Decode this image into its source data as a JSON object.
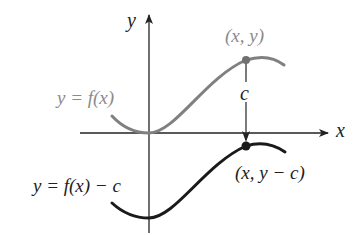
{
  "diagram": {
    "axes": {
      "x_label": "x",
      "y_label": "y"
    },
    "curves": [
      {
        "name": "original",
        "label": "y = f(x)",
        "color": "#808080",
        "point_label": "(x, y)"
      },
      {
        "name": "shifted",
        "label": "y = f(x) − c",
        "color": "#1a1a1a",
        "point_label": "(x, y − c)"
      }
    ],
    "shift_label": "c"
  }
}
